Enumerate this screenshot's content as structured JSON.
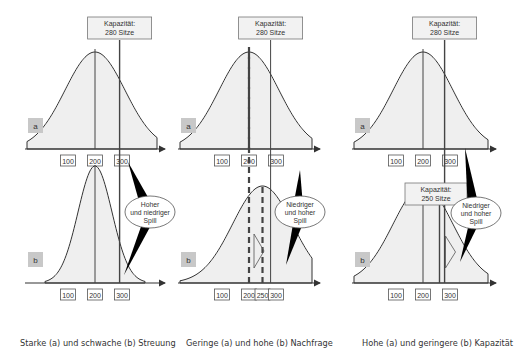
{
  "chart_data": {
    "type": "diagram",
    "title": "",
    "panels": [
      {
        "id": "streuung",
        "caption": "Starke (a) und schwache (b) Streuung",
        "capacity_label_top": [
          "Kapazität:",
          "280 Sitze"
        ],
        "spill_label": [
          "Hoher",
          "und niedriger",
          "Spill"
        ],
        "rows": [
          {
            "label": "a",
            "mean": 200,
            "spread": "wide",
            "capacity": 280,
            "ticks": [
              "100",
              "200",
              "300"
            ]
          },
          {
            "label": "b",
            "mean": 200,
            "spread": "narrow",
            "capacity": 280,
            "ticks": [
              "100",
              "200",
              "300"
            ]
          }
        ]
      },
      {
        "id": "nachfrage",
        "caption": "Geringe (a) und hohe (b) Nachfrage",
        "capacity_label_top": [
          "Kapazität:",
          "280 Sitze"
        ],
        "spill_label": [
          "Niedriger",
          "und hoher",
          "Spill"
        ],
        "rows": [
          {
            "label": "a",
            "mean": 200,
            "spread": "wide",
            "capacity": 280,
            "ticks": [
              "100",
              "200",
              "300"
            ]
          },
          {
            "label": "b",
            "mean": 250,
            "spread": "wide",
            "capacity": 280,
            "ticks": [
              "100",
              "200",
              "250",
              "300"
            ]
          }
        ]
      },
      {
        "id": "kapazitaet",
        "caption": "Hohe (a) und geringere (b) Kapazität",
        "capacity_label_top": [
          "Kapazität:",
          "280 Sitze"
        ],
        "capacity_label_bottom": [
          "Kapazität:",
          "250 Sitze"
        ],
        "spill_label": [
          "Niedriger",
          "und hoher",
          "Spill"
        ],
        "rows": [
          {
            "label": "a",
            "mean": 200,
            "spread": "wide",
            "capacity": 280,
            "ticks": [
              "100",
              "200",
              "300"
            ]
          },
          {
            "label": "b",
            "mean": 200,
            "spread": "wide",
            "capacity": 250,
            "ticks": [
              "100",
              "200",
              "300"
            ]
          }
        ]
      }
    ]
  },
  "colors": {
    "curve_fill": "#efefef",
    "curve_stroke": "#333333",
    "label_box": "#c8c8c8",
    "callout": "#000000"
  }
}
